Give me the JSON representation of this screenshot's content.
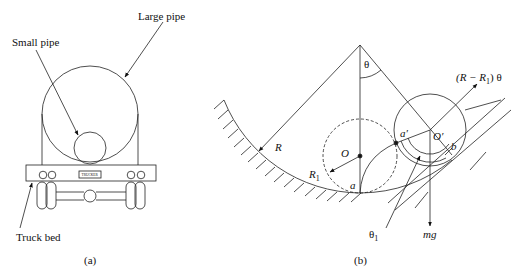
{
  "figure_a": {
    "caption": "(a)",
    "labels": {
      "large_pipe": "Large pipe",
      "small_pipe": "Small pipe",
      "truck_bed": "Truck bed",
      "truck_plate": "TRUCKER"
    }
  },
  "figure_b": {
    "caption": "(b)",
    "labels": {
      "theta": "θ",
      "arc_length": "(R − R",
      "arc_length_sub": "1",
      "arc_length_tail": ") θ",
      "R": "R",
      "R1": "R",
      "R1_sub": "1",
      "O": "O",
      "O_prime": "O′",
      "a": "a",
      "a_prime": "a′",
      "b": "b",
      "theta1": "θ",
      "theta1_sub": "1",
      "mg": "mg"
    }
  }
}
